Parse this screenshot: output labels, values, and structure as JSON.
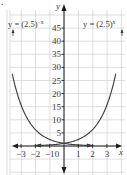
{
  "figure": {
    "corner_mark": "."
  },
  "chart_data": {
    "type": "line",
    "title": "",
    "xlabel": "x",
    "ylabel": "y",
    "xlim": [
      -3.7,
      3.7
    ],
    "ylim": [
      -7,
      50
    ],
    "x_ticks": [
      -3,
      -2,
      -1,
      0,
      1,
      2,
      3
    ],
    "x_tick_labels": [
      "−3",
      "−2",
      "−1",
      "0",
      "1",
      "2",
      "3"
    ],
    "y_ticks": [
      5,
      10,
      15,
      20,
      25,
      30,
      35,
      40,
      45
    ],
    "y_tick_labels": [
      "5",
      "10",
      "15",
      "20",
      "25",
      "30",
      "35",
      "40",
      "45"
    ],
    "grid": true,
    "series": [
      {
        "name": "y = (2.5)^x",
        "label": "y = (2.5)",
        "exponent": "x",
        "x": [
          -3,
          -2,
          -1,
          0,
          1,
          2,
          3,
          3.3
        ],
        "values": [
          0.064,
          0.16,
          0.4,
          1,
          2.5,
          6.25,
          15.63,
          20.5
        ]
      },
      {
        "name": "y = (2.5)^-x",
        "label": "y = (2.5)",
        "exponent": "−x",
        "x": [
          -3.3,
          -3,
          -2,
          -1,
          0,
          1,
          2,
          3
        ],
        "values": [
          20.5,
          15.63,
          6.25,
          2.5,
          1,
          0.4,
          0.16,
          0.064
        ]
      }
    ],
    "legend": "inline labels at top with arrows pointing to curves"
  }
}
